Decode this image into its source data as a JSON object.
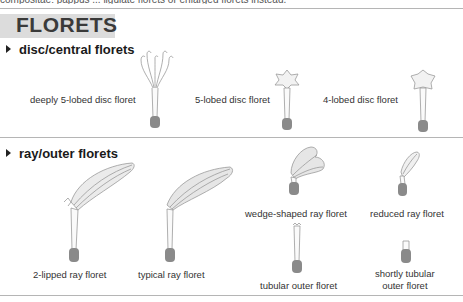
{
  "top_cut_text": "compositae: pappus ... ligulate florets or enlarged florets instead.",
  "title": "FLORETS",
  "sections": [
    {
      "heading": "disc/central florets",
      "items": [
        {
          "label": "deeply 5-lobed disc floret",
          "icon": "deeply-5-lobed-disc-floret-icon"
        },
        {
          "label": "5-lobed disc floret",
          "icon": "5-lobed-disc-floret-icon"
        },
        {
          "label": "4-lobed disc floret",
          "icon": "4-lobed-disc-floret-icon"
        }
      ]
    },
    {
      "heading": "ray/outer florets",
      "items": [
        {
          "label": "2-lipped ray floret",
          "icon": "2-lipped-ray-floret-icon"
        },
        {
          "label": "typical ray floret",
          "icon": "typical-ray-floret-icon"
        },
        {
          "label": "wedge-shaped ray floret",
          "icon": "wedge-shaped-ray-floret-icon"
        },
        {
          "label": "reduced ray floret",
          "icon": "reduced-ray-floret-icon"
        },
        {
          "label": "tubular outer floret",
          "icon": "tubular-outer-floret-icon"
        },
        {
          "label_line1": "shortly tubular",
          "label_line2": "outer floret",
          "icon": "shortly-tubular-outer-floret-icon"
        }
      ]
    }
  ],
  "colors": {
    "banner": "#dcdcdc",
    "ovary": "#8a8a8a",
    "petal": "#ebebeb",
    "outline": "#9a9a9a",
    "rule": "#b5b5b5"
  }
}
